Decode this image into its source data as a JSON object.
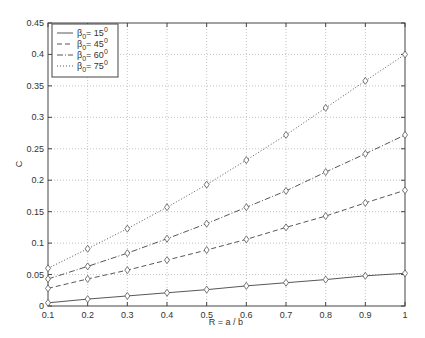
{
  "chart_data": {
    "type": "line",
    "title": "",
    "xlabel": "R = a / b",
    "ylabel": "C",
    "xlim": [
      0.1,
      1
    ],
    "ylim": [
      0,
      0.45
    ],
    "grid": true,
    "legend_position": "upper-left",
    "x": [
      0.1,
      0.2,
      0.3,
      0.4,
      0.5,
      0.6,
      0.7,
      0.8,
      0.9,
      1.0
    ],
    "x_ticks": [
      "0.1",
      "0.2",
      "0.3",
      "0.4",
      "0.5",
      "0.6",
      "0.7",
      "0.8",
      "0.9",
      "1"
    ],
    "y_ticks": [
      "0",
      "0.05",
      "0.1",
      "0.15",
      "0.2",
      "0.25",
      "0.3",
      "0.35",
      "0.4",
      "0.45"
    ],
    "marker": "diamond",
    "series": [
      {
        "name": "β0 = 15°",
        "label_main": "β",
        "label_sub": "0",
        "label_rest": "= 15",
        "label_sup": "0",
        "style": "solid",
        "values": [
          0.005,
          0.011,
          0.016,
          0.021,
          0.026,
          0.032,
          0.037,
          0.042,
          0.048,
          0.052
        ]
      },
      {
        "name": "β0 = 45°",
        "label_main": "β",
        "label_sub": "0",
        "label_rest": "= 45",
        "label_sup": "0",
        "style": "dashed",
        "values": [
          0.028,
          0.043,
          0.057,
          0.073,
          0.089,
          0.106,
          0.125,
          0.143,
          0.164,
          0.184
        ]
      },
      {
        "name": "β0 = 60°",
        "label_main": "β",
        "label_sub": "0",
        "label_rest": "= 60",
        "label_sup": "0",
        "style": "dashdot",
        "values": [
          0.043,
          0.063,
          0.084,
          0.107,
          0.131,
          0.157,
          0.183,
          0.213,
          0.242,
          0.272
        ]
      },
      {
        "name": "β0 = 75°",
        "label_main": "β",
        "label_sub": "0",
        "label_rest": "= 75",
        "label_sup": "0",
        "style": "dotted",
        "values": [
          0.06,
          0.091,
          0.123,
          0.157,
          0.193,
          0.232,
          0.272,
          0.315,
          0.358,
          0.4
        ]
      }
    ]
  }
}
